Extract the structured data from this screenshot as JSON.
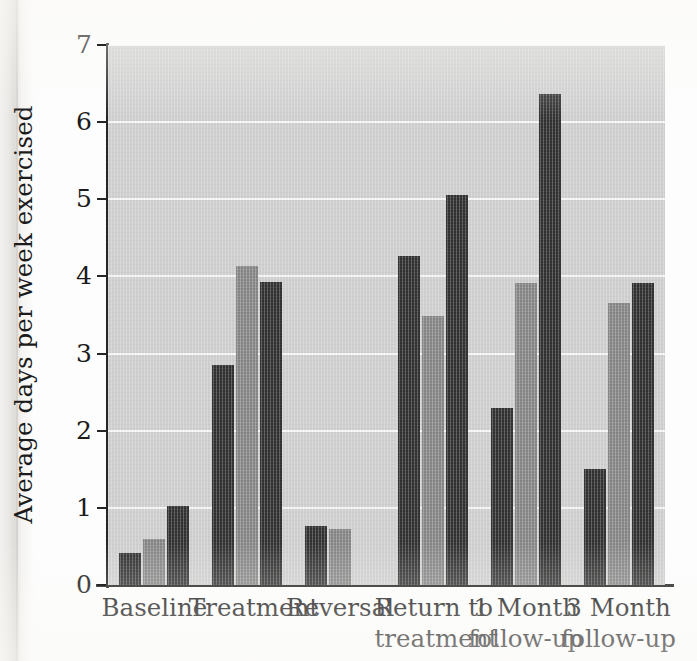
{
  "chart_data": {
    "type": "bar",
    "title": "",
    "subtitle": "",
    "xlabel": "",
    "ylabel": "Average days per week exercised",
    "ylim": [
      0,
      7
    ],
    "ytick_labels": [
      "7",
      "6",
      "5",
      "4",
      "3",
      "2",
      "1",
      "0"
    ],
    "ytick_values": [
      7,
      6,
      5,
      4,
      3,
      2,
      1,
      0
    ],
    "grid": true,
    "grid_axis": "y",
    "legend": false,
    "legend_position": "none",
    "categories": [
      "Baseline",
      "Treatment",
      "Reversal",
      "Return to treatment",
      "1 Month follow-up",
      "3 Month follow-up"
    ],
    "category_label_lines": [
      [
        "Baseline",
        ""
      ],
      [
        "Treatment",
        ""
      ],
      [
        "Reversal",
        ""
      ],
      [
        "Return to",
        "treatment"
      ],
      [
        "1 Month",
        "follow-up"
      ],
      [
        "3 Month",
        "follow-up"
      ]
    ],
    "series": [
      {
        "name": "Participant 1",
        "color": "#333333",
        "values": [
          0.42,
          2.85,
          0.77,
          4.27,
          2.3,
          1.5
        ]
      },
      {
        "name": "Participant 2",
        "color": "#8b8b8b",
        "values": [
          0.6,
          4.14,
          0.72,
          3.49,
          3.92,
          3.66
        ]
      },
      {
        "name": "Participant 3",
        "color": "#333333",
        "values": [
          1.03,
          3.93,
          null,
          5.05,
          6.37,
          3.92
        ]
      }
    ],
    "plot_background": "#cfcfcf",
    "gridline_color": "#f4f4f4",
    "axis_color": "#262626"
  }
}
